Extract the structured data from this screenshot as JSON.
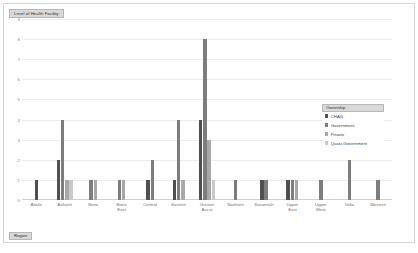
{
  "chart": {
    "title": "Level of Health Facility",
    "xaxis_field_label": "Region"
  },
  "legend": {
    "title": "Ownership",
    "position": "right-inside",
    "items": [
      {
        "label": "CHAG",
        "color": "#4f4f4f"
      },
      {
        "label": "Government",
        "color": "#7d7d7d"
      },
      {
        "label": "Private",
        "color": "#a8a8a8"
      },
      {
        "label": "Quasi-Government",
        "color": "#c9c9c9"
      }
    ]
  },
  "chart_data": {
    "type": "bar",
    "title": "Level of Health Facility",
    "xlabel": "Region",
    "ylabel": "",
    "ylim": [
      0,
      9
    ],
    "yticks": [
      0,
      1,
      2,
      3,
      4,
      5,
      6,
      7,
      8,
      9
    ],
    "grid": true,
    "categories": [
      "Ahafo",
      "Ashanti",
      "Bono",
      "Bono East",
      "Central",
      "Eastern",
      "Greater Accra",
      "Northern",
      "Savannah",
      "Upper East",
      "Upper West",
      "Volta",
      "Western"
    ],
    "series": [
      {
        "name": "CHAG",
        "color": "#4f4f4f",
        "values": [
          1,
          2,
          0,
          0,
          1,
          1,
          4,
          0,
          1,
          1,
          0,
          0,
          0
        ]
      },
      {
        "name": "Government",
        "color": "#7d7d7d",
        "values": [
          0,
          4,
          1,
          1,
          2,
          4,
          8,
          1,
          1,
          1,
          1,
          2,
          1
        ]
      },
      {
        "name": "Private",
        "color": "#a8a8a8",
        "values": [
          0,
          1,
          1,
          1,
          0,
          1,
          3,
          0,
          0,
          1,
          0,
          0,
          0
        ]
      },
      {
        "name": "Quasi-Government",
        "color": "#c9c9c9",
        "values": [
          0,
          1,
          0,
          0,
          0,
          0,
          1,
          0,
          0,
          0,
          0,
          0,
          0
        ]
      }
    ]
  }
}
